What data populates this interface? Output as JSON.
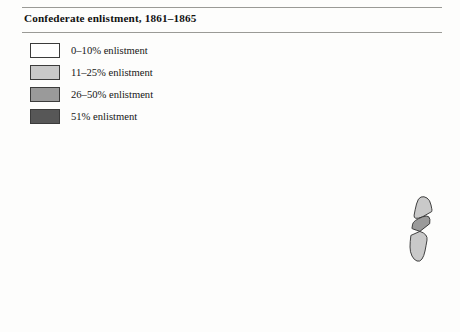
{
  "figure": {
    "title": "Confederate enlistment, 1861–1865",
    "background_color": "#fdfdfc",
    "rule_color": "#9a9a96"
  },
  "legend": {
    "position": "top-left",
    "items": [
      {
        "label": "0–10% enlistment",
        "color": "#ffffff",
        "bin": "0-10",
        "min": 0,
        "max": 10
      },
      {
        "label": "11–25% enlistment",
        "color": "#c9c9c9",
        "bin": "11-25",
        "min": 11,
        "max": 25
      },
      {
        "label": "26–50% enlistment",
        "color": "#9a9a9a",
        "bin": "26-50",
        "min": 26,
        "max": 50
      },
      {
        "label": "51% enlistment",
        "color": "#575757",
        "bin": "51+",
        "min": 51,
        "max": 100
      }
    ]
  },
  "chart_data": {
    "type": "map",
    "subtype": "choropleth",
    "title": "Confederate enlistment, 1861–1865",
    "region": "Virginia (including West Virginia panhandle), United States",
    "unit": "county",
    "value_label": "percent enlistment",
    "categories": [
      "0–10% enlistment",
      "11–25% enlistment",
      "26–50% enlistment",
      "51% enlistment"
    ],
    "category_colors": [
      "#ffffff",
      "#c9c9c9",
      "#9a9a9a",
      "#575757"
    ],
    "legend_position": "top-left",
    "grid": false,
    "class_counts": {
      "0–10% enlistment": 27,
      "11–25% enlistment": 29,
      "26–50% enlistment": 22,
      "51% enlistment": 86
    },
    "regions": [
      {
        "name": "northern-panhandle",
        "class": 0
      },
      {
        "name": "northwest-mountains",
        "class": 1
      },
      {
        "name": "allegheny-highlands",
        "class": 2
      },
      {
        "name": "shenandoah-valley",
        "class": 3
      },
      {
        "name": "piedmont",
        "class": 3
      },
      {
        "name": "tidewater",
        "class": 3
      },
      {
        "name": "eastern-shore",
        "class": 2
      },
      {
        "name": "southside",
        "class": 3
      },
      {
        "name": "southwest-tip",
        "class": 3
      }
    ]
  }
}
